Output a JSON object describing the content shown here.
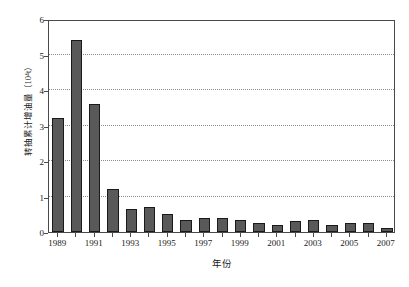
{
  "chart_data": {
    "type": "bar",
    "title": "",
    "xlabel": "年份",
    "ylabel": "转抽累计增油量（10⁴t）",
    "categories": [
      "1989",
      "1990",
      "1991",
      "1992",
      "1993",
      "1994",
      "1995",
      "1996",
      "1997",
      "1998",
      "1999",
      "2000",
      "2001",
      "2002",
      "2003",
      "2004",
      "2005",
      "2006",
      "2007"
    ],
    "values": [
      3.2,
      5.4,
      3.6,
      1.2,
      0.65,
      0.7,
      0.5,
      0.35,
      0.4,
      0.4,
      0.35,
      0.25,
      0.2,
      0.3,
      0.35,
      0.2,
      0.25,
      0.25,
      0.1
    ],
    "ylim": [
      0,
      6
    ],
    "yticks": [
      0,
      1,
      2,
      3,
      4,
      5,
      6
    ],
    "ytick_labels": [
      "0",
      "1",
      "2",
      "3",
      "4",
      "5",
      "6"
    ],
    "xtick_labels": [
      "1989",
      "1991",
      "1993",
      "1995",
      "1997",
      "1999",
      "2001",
      "2003",
      "2005",
      "2007"
    ],
    "grid": true,
    "grid_style": "dotted",
    "legend": "none",
    "bar_color": "#595959",
    "bar_edge_color": "#1a1a1a",
    "frame_color": "#4a4a4a",
    "grid_color": "#8c8c8c",
    "background": "#ffffff"
  }
}
